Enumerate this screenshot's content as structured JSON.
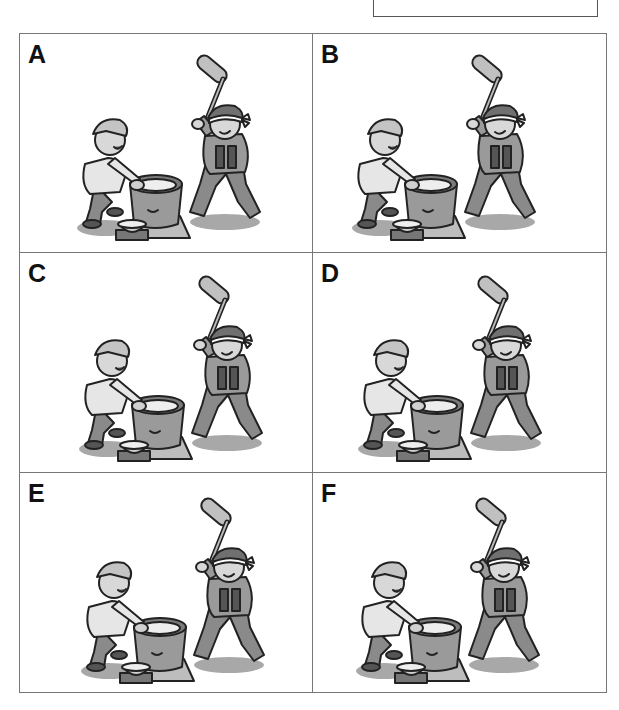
{
  "answer_box": {
    "value": ""
  },
  "panels": [
    {
      "label": "A",
      "offset_x": 0,
      "offset_y": 0,
      "mallet_tilt": 0
    },
    {
      "label": "B",
      "offset_x": -18,
      "offset_y": 0,
      "mallet_tilt": 0
    },
    {
      "label": "C",
      "offset_x": 2,
      "offset_y": 2,
      "mallet_tilt": 0
    },
    {
      "label": "D",
      "offset_x": -12,
      "offset_y": 2,
      "mallet_tilt": 0
    },
    {
      "label": "E",
      "offset_x": 4,
      "offset_y": 4,
      "mallet_tilt": 0
    },
    {
      "label": "F",
      "offset_x": -14,
      "offset_y": 4,
      "mallet_tilt": 0
    }
  ],
  "colors": {
    "outline": "#222222",
    "fill_mid": "#9a9a9a",
    "fill_light": "#c8c8c8",
    "fill_dark": "#6e6e6e",
    "skin": "#d8d8d8",
    "shadow": "#a8a8a8"
  }
}
